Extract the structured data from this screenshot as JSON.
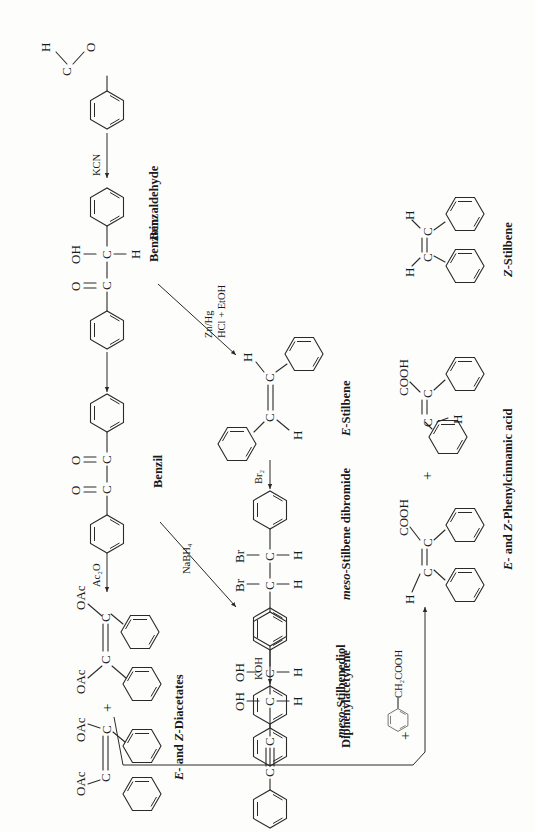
{
  "figure": {
    "orientation": "rotated-90-ccw"
  },
  "compounds": {
    "benzaldehyde": {
      "name": "Benzaldehyde",
      "atoms": {
        "o": "O",
        "c": "C",
        "h": "H"
      }
    },
    "benzoin": {
      "name": "Benzoin",
      "atoms": {
        "oh": "OH",
        "o": "O",
        "c1": "C",
        "c2": "C",
        "h": "H"
      }
    },
    "benzil": {
      "name": "Benzil",
      "atoms": {
        "o1": "O",
        "o2": "O",
        "c1": "C",
        "c2": "C"
      }
    },
    "diacetates": {
      "name_prefix_e": "E",
      "name_mid": "- and ",
      "name_prefix_z": "Z",
      "name_suffix": "-Diacetates",
      "atoms": {
        "oac": "OAc",
        "c": "C"
      },
      "plus": "+"
    },
    "meso_stilbenediol": {
      "name_prefix": "meso",
      "name_suffix": "-Stilbenediol",
      "atoms": {
        "oh": "OH",
        "c": "C",
        "h": "H"
      }
    },
    "e_stilbene": {
      "name_prefix": "E",
      "name_suffix": "-Stilbene",
      "atoms": {
        "c": "C",
        "h": "H"
      }
    },
    "meso_stilbene_dibromide": {
      "name_prefix": "meso",
      "name_suffix": "-Stilbene dibromide",
      "atoms": {
        "br": "Br",
        "c": "C",
        "h": "H"
      }
    },
    "diphenylacetylene": {
      "name": "Diphenylacetylene",
      "atoms": {
        "c": "C"
      }
    },
    "phenylcinnamic_acid": {
      "name_prefix_e": "E",
      "name_mid": "- and ",
      "name_prefix_z": "Z",
      "name_suffix": "-Phenylcinnamic acid",
      "atoms": {
        "cooh": "COOH",
        "c": "C",
        "h": "H"
      },
      "plus": "+"
    },
    "z_stilbene": {
      "name_prefix": "Z",
      "name_suffix": "-Stilbene",
      "atoms": {
        "c": "C",
        "h": "H"
      }
    },
    "dl_stilbene_dibromide": {
      "name_prefix": "dl",
      "name_suffix": "-Stilbene dibromide",
      "atoms": {
        "br": "Br",
        "c": "C",
        "h": "H"
      }
    },
    "phenylacetic_acid": {
      "substituent": "CH₂COOH",
      "plus": "+"
    }
  },
  "reagents": {
    "kcn": "KCN",
    "ac2o": "Ac₂O",
    "nabh4": "NaBH₄",
    "zn_hg": "Zn/Hg",
    "hcl_etoh": "HCl + EtOH",
    "br2_a": "Br₂",
    "koh": "KOH",
    "br2_b": "Br₂",
    "copper": "copper",
    "chromite": "chromite",
    "catalyst": "catalyst"
  }
}
